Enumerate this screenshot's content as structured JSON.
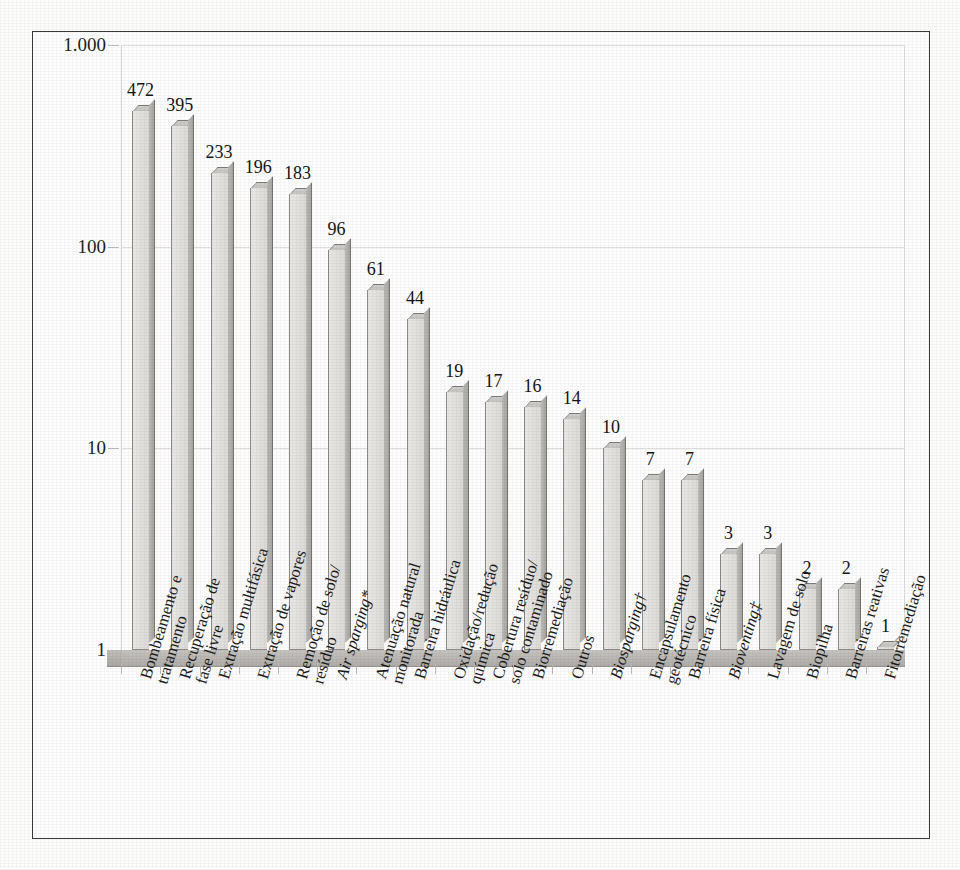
{
  "chart_data": {
    "type": "bar",
    "title": "",
    "subtitle": "",
    "xlabel": "",
    "ylabel": "",
    "scale": "log",
    "ylim": [
      1,
      1000
    ],
    "grid": true,
    "legend": "none",
    "ytick_labels": [
      "1.000",
      "100",
      "10",
      "1"
    ],
    "ytick_values": [
      1000,
      100,
      10,
      1
    ],
    "categories": [
      "Bombeamento e tratamento",
      "Recuperação de fase livre",
      "Extração multifásica",
      "Extração de vapores",
      "Remoção de solo/ resíduo",
      "Air sparging*",
      "Atenuação natural monitorada",
      "Barreira hidráulica",
      "Oxidação/redução química",
      "Cobertura resíduo/ solo contaminado",
      "Biorremediação",
      "Outros",
      "Biosparging†",
      "Encapsulamento geotécnico",
      "Barreira física",
      "Bioventing‡",
      "Lavagem de solo",
      "Biopilha",
      "Barreiras reativas",
      "Fitorremediação"
    ],
    "category_lines": [
      [
        "Bombeamento e",
        "tratamento"
      ],
      [
        "Recuperação de",
        "fase livre"
      ],
      [
        "Extração multifásica",
        ""
      ],
      [
        "Extração de vapores",
        ""
      ],
      [
        "Remoção de solo/",
        "resíduo"
      ],
      [
        "Air sparging*",
        ""
      ],
      [
        "Atenuação natural",
        "monitorada"
      ],
      [
        "Barreira hidráulica",
        ""
      ],
      [
        "Oxidação/redução",
        "química"
      ],
      [
        "Cobertura resíduo/",
        "solo contaminado"
      ],
      [
        "Biorremediação",
        ""
      ],
      [
        "Outros",
        ""
      ],
      [
        "Biosparging†",
        ""
      ],
      [
        "Encapsulamento",
        "geotécnico"
      ],
      [
        "Barreira física",
        ""
      ],
      [
        "Bioventing‡",
        ""
      ],
      [
        "Lavagem de solo",
        ""
      ],
      [
        "Biopilha",
        ""
      ],
      [
        "Barreiras reativas",
        ""
      ],
      [
        "Fitorremediação",
        ""
      ]
    ],
    "category_italic": [
      false,
      false,
      false,
      false,
      false,
      true,
      false,
      false,
      false,
      false,
      false,
      false,
      true,
      false,
      false,
      true,
      false,
      false,
      false,
      false
    ],
    "values": [
      472,
      395,
      233,
      196,
      183,
      96,
      61,
      44,
      19,
      17,
      16,
      14,
      10,
      7,
      7,
      3,
      3,
      2,
      2,
      1
    ]
  },
  "colors": {
    "bar_face": "#e4e3e0",
    "bar_side": "#b1afab",
    "bar_top": "#cbc9c5",
    "bar_outline": "#8d8b88",
    "floor": "#b6b3af",
    "grid": "#dedede",
    "frame": "#3a3a3a",
    "text": "#1b1b1b",
    "background": "#fefefe"
  }
}
